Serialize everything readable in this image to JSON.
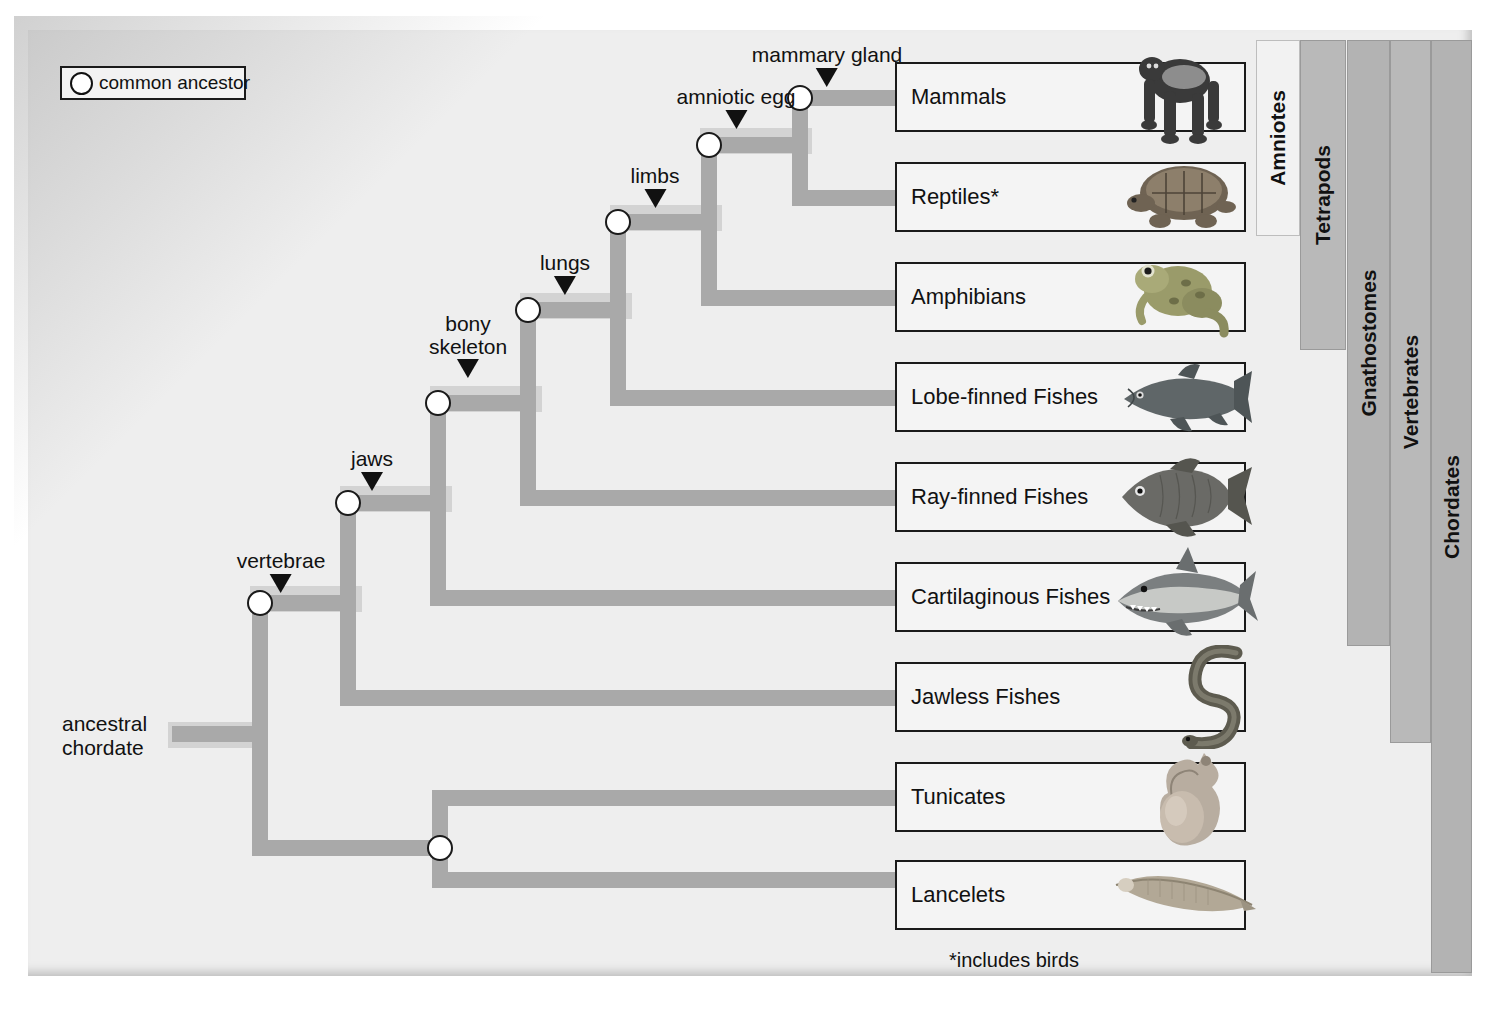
{
  "figure": {
    "type": "phylogenetic-tree",
    "footnote": "*includes birds"
  },
  "legend": {
    "symbol": "open-circle",
    "label": "common ancestor"
  },
  "root": {
    "label_line1": "ancestral",
    "label_line2": "chordate"
  },
  "traits": [
    {
      "id": "vertebrae",
      "label": "vertebrae",
      "x": 281,
      "y": 554
    },
    {
      "id": "jaws",
      "label": "jaws",
      "x": 372,
      "y": 453
    },
    {
      "id": "bony-skeleton",
      "label_line1": "bony",
      "label_line2": "skeleton",
      "x": 466,
      "y": 320
    },
    {
      "id": "lungs",
      "label": "lungs",
      "x": 563,
      "y": 258
    },
    {
      "id": "limbs",
      "label": "limbs",
      "x": 653,
      "y": 171
    },
    {
      "id": "amniotic-egg",
      "label": "amniotic egg",
      "x": 736,
      "y": 93
    },
    {
      "id": "mammary-gland",
      "label": "mammary gland",
      "x": 827,
      "y": 50
    }
  ],
  "nodes": [
    {
      "id": "chordates-root",
      "x": 260,
      "y": 733,
      "trait": "ancestral chordate"
    },
    {
      "id": "vertebrates",
      "x": 348,
      "y": 603,
      "trait": "vertebrae"
    },
    {
      "id": "gnathostomes",
      "x": 438,
      "y": 503,
      "trait": "jaws"
    },
    {
      "id": "bony-fishes",
      "x": 528,
      "y": 403,
      "trait": "bony skeleton"
    },
    {
      "id": "lunged",
      "x": 618,
      "y": 310,
      "trait": "lungs"
    },
    {
      "id": "tetrapods",
      "x": 709,
      "y": 222,
      "trait": "limbs"
    },
    {
      "id": "amniotes",
      "x": 800,
      "y": 145,
      "trait": "amniotic egg"
    },
    {
      "id": "cephalochordate-split",
      "x": 440,
      "y": 848,
      "trait": ""
    }
  ],
  "taxa": [
    {
      "id": "mammals",
      "label": "Mammals",
      "icon": "gorilla-illustration",
      "y": 62
    },
    {
      "id": "reptiles",
      "label": "Reptiles*",
      "icon": "turtle-illustration",
      "y": 162
    },
    {
      "id": "amphibians",
      "label": "Amphibians",
      "icon": "frog-illustration",
      "y": 262
    },
    {
      "id": "lobe-finned-fishes",
      "label": "Lobe-finned Fishes",
      "icon": "coelacanth-illustration",
      "y": 362
    },
    {
      "id": "ray-finned-fishes",
      "label": "Ray-finned Fishes",
      "icon": "bony-fish-illustration",
      "y": 462
    },
    {
      "id": "cartilaginous-fishes",
      "label": "Cartilaginous Fishes",
      "icon": "shark-illustration",
      "y": 562
    },
    {
      "id": "jawless-fishes",
      "label": "Jawless Fishes",
      "icon": "lamprey-illustration",
      "y": 662
    },
    {
      "id": "tunicates",
      "label": "Tunicates",
      "icon": "tunicate-illustration",
      "y": 762
    },
    {
      "id": "lancelets",
      "label": "Lancelets",
      "icon": "lancelet-illustration",
      "y": 860
    }
  ],
  "clades": [
    {
      "id": "amniotes",
      "label": "Amniotes",
      "x": 1256,
      "y": 40,
      "w": 44,
      "h": 196,
      "tone": "light"
    },
    {
      "id": "tetrapods",
      "label": "Tetrapods",
      "x": 1300,
      "y": 40,
      "w": 46,
      "h": 310,
      "tone": "dark"
    },
    {
      "id": "gnathostomes",
      "label": "Gnathostomes",
      "x": 1347,
      "y": 40,
      "w": 43,
      "h": 606,
      "tone": "dark2"
    },
    {
      "id": "vertebrates",
      "label": "Vertebrates",
      "x": 1390,
      "y": 40,
      "w": 41,
      "h": 703,
      "tone": "dark"
    },
    {
      "id": "chordates",
      "label": "Chordates",
      "x": 1431,
      "y": 40,
      "w": 41,
      "h": 933,
      "tone": "dark2"
    }
  ],
  "colors": {
    "branch": "#a9a9a9",
    "node_fill": "#ffffff",
    "node_stroke": "#1a1a1a",
    "sheet": "#eeeeee",
    "box_fill": "#f4f4f4",
    "clade_dark": "#b9b9b9",
    "clade_light": "#f2f2f2"
  }
}
